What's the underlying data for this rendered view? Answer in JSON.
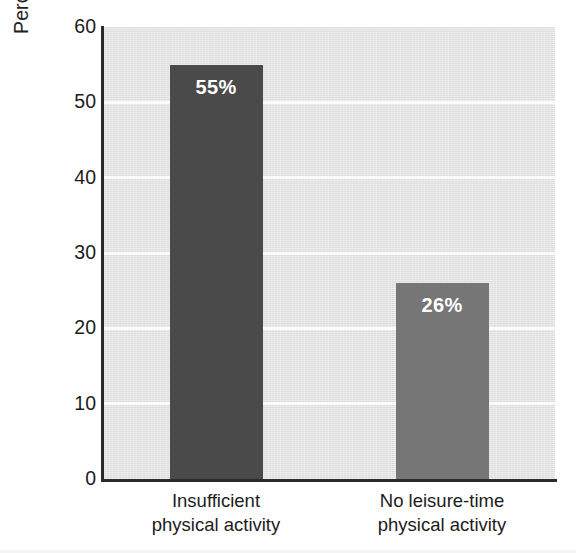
{
  "chart_data": {
    "type": "bar",
    "title": "",
    "subtitle": "",
    "xlabel": "",
    "ylabel": "Percent (%) of adults in the United States",
    "categories": [
      "Insufficient physical activity",
      "No leisure-time physical activity"
    ],
    "category_lines": [
      [
        "Insufficient",
        "physical activity"
      ],
      [
        "No leisure-time",
        "physical activity"
      ]
    ],
    "values": [
      55,
      26
    ],
    "value_labels": [
      "55%",
      "26%"
    ],
    "bar_colors": [
      "#4a4a4a",
      "#767676"
    ],
    "ylim": [
      0,
      60
    ],
    "ytick_values": [
      0,
      10,
      20,
      30,
      40,
      50,
      60
    ],
    "ytick_labels": [
      "0",
      "10",
      "20",
      "30",
      "40",
      "50",
      "60"
    ],
    "grid": true,
    "gridline_values": [
      10,
      20,
      30,
      40,
      50
    ],
    "gridline_color": "#fbfbfb",
    "plot_background": "#e4e4e4",
    "axis_color": "#2b2b2b",
    "legend": "none",
    "value_label_color": "#ffffff"
  }
}
